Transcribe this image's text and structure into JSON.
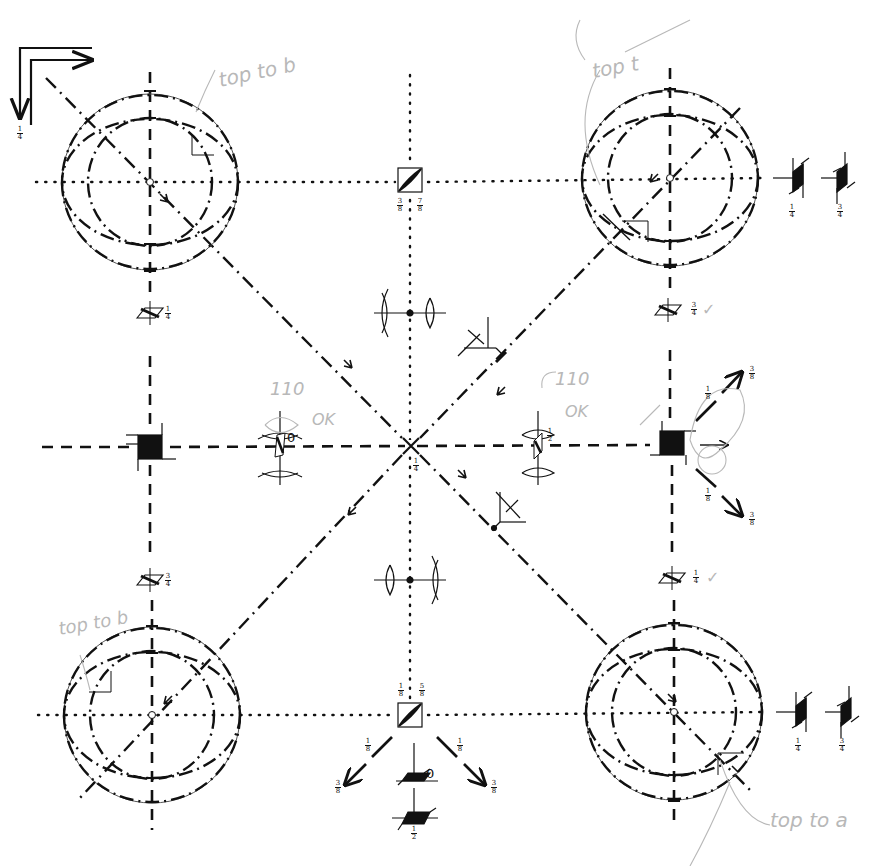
{
  "diagram": {
    "title": "",
    "corner_indicator": {
      "label": "1/4",
      "num": "1",
      "den": "4"
    },
    "spheres": [
      {
        "id": "top-left",
        "cx": 150,
        "cy": 182,
        "annotation": "top to b"
      },
      {
        "id": "top-right",
        "cx": 670,
        "cy": 178,
        "annotation": "top t"
      },
      {
        "id": "bottom-left",
        "cx": 152,
        "cy": 715,
        "annotation": "top to b"
      },
      {
        "id": "bottom-right",
        "cx": 674,
        "cy": 712,
        "annotation": "top to a"
      }
    ],
    "center_point": {
      "x": 411,
      "y": 446,
      "label": {
        "num": "1",
        "den": "4"
      }
    },
    "waveplates": [
      {
        "id": "wp-left-top",
        "x": 150,
        "y": 313,
        "num": "1",
        "den": "4"
      },
      {
        "id": "wp-left-bottom",
        "x": 150,
        "y": 580,
        "num": "3",
        "den": "4"
      },
      {
        "id": "wp-right-top",
        "x": 668,
        "y": 310,
        "num": "3",
        "den": "4",
        "check": "✓"
      },
      {
        "id": "wp-right-bottom",
        "x": 672,
        "y": 578,
        "num": "1",
        "den": "4",
        "check": "✓"
      }
    ],
    "beam_splitters": [
      {
        "id": "bs-top",
        "x": 410,
        "y": 180,
        "labels": [
          {
            "num": "3",
            "den": "8"
          },
          {
            "num": "7",
            "den": "8"
          }
        ]
      },
      {
        "id": "bs-bottom",
        "x": 410,
        "y": 715,
        "labels": [
          {
            "num": "1",
            "den": "8"
          },
          {
            "num": "5",
            "den": "8"
          }
        ]
      }
    ],
    "lens_pairs": [
      {
        "id": "lens-top",
        "x": 410,
        "y": 313
      },
      {
        "id": "lens-bottom",
        "x": 410,
        "y": 580
      },
      {
        "id": "lens-left",
        "x": 280,
        "y": 447,
        "annotation_top": "110",
        "annotation_ok": "OK",
        "plate_label": "0"
      },
      {
        "id": "lens-right",
        "x": 538,
        "y": 447,
        "annotation_top": "110",
        "annotation_ok": "OK",
        "plate_label": {
          "num": "1",
          "den": "2"
        }
      }
    ],
    "mirrors": [
      {
        "id": "mirror-upper",
        "x": 480,
        "y": 340
      },
      {
        "id": "mirror-lower",
        "x": 508,
        "y": 518
      }
    ],
    "detectors": [
      {
        "id": "det-left",
        "x": 150,
        "y": 447
      },
      {
        "id": "det-right",
        "x": 672,
        "y": 443,
        "outputs": [
          {
            "dir": "up",
            "labels": [
              {
                "num": "1",
                "den": "8"
              },
              {
                "num": "3",
                "den": "8"
              }
            ]
          },
          {
            "dir": "right"
          },
          {
            "dir": "down",
            "labels": [
              {
                "num": "1",
                "den": "8"
              },
              {
                "num": "3",
                "den": "8"
              }
            ]
          }
        ]
      }
    ],
    "right_plates": [
      {
        "id": "rp-top-1",
        "x": 797,
        "y": 178,
        "num": "1",
        "den": "4"
      },
      {
        "id": "rp-top-2",
        "x": 841,
        "y": 178,
        "num": "3",
        "den": "4"
      },
      {
        "id": "rp-bottom-1",
        "x": 800,
        "y": 712,
        "num": "1",
        "den": "4"
      },
      {
        "id": "rp-bottom-2",
        "x": 845,
        "y": 712,
        "num": "3",
        "den": "4"
      }
    ],
    "bottom_outputs": {
      "left_arrow": {
        "labels": [
          {
            "num": "1",
            "den": "8"
          },
          {
            "num": "3",
            "den": "8"
          }
        ]
      },
      "right_arrow": {
        "labels": [
          {
            "num": "1",
            "den": "8"
          },
          {
            "num": "3",
            "den": "8"
          }
        ]
      },
      "plate_upper": {
        "label": "0"
      },
      "plate_lower": {
        "num": "1",
        "den": "2"
      }
    }
  },
  "colors": {
    "ink": "#111111",
    "pencil": "#b8b8b8",
    "thin_circle": "#555555",
    "background": "#ffffff"
  }
}
